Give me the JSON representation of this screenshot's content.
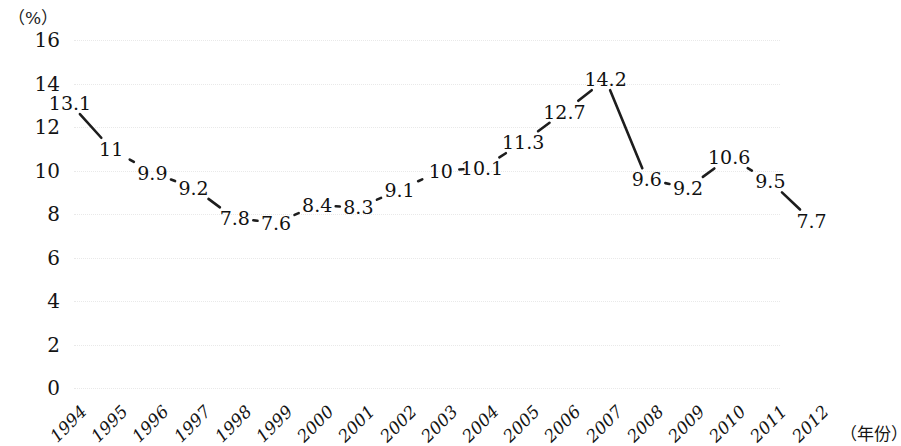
{
  "chart_data": {
    "type": "line",
    "title": "",
    "xlabel": "（年份）",
    "ylabel": "（%）",
    "ylim": [
      0,
      16
    ],
    "yticks": [
      "0",
      "2",
      "4",
      "6",
      "8",
      "10",
      "12",
      "14",
      "16"
    ],
    "grid": true,
    "legend": "none",
    "categories": [
      "1994",
      "1995",
      "1996",
      "1997",
      "1998",
      "1999",
      "2000",
      "2001",
      "2002",
      "2003",
      "2004",
      "2005",
      "2006",
      "2007",
      "2008",
      "2009",
      "2010",
      "2011",
      "2012"
    ],
    "values": [
      13.1,
      11,
      9.9,
      9.2,
      7.8,
      7.6,
      8.4,
      8.3,
      9.1,
      10,
      10.1,
      11.3,
      12.7,
      14.2,
      9.6,
      9.2,
      10.6,
      9.5,
      7.7
    ],
    "point_labels": [
      "13.1",
      "11",
      "9.9",
      "9.2",
      "7.8",
      "7.6",
      "8.4",
      "8.3",
      "9.1",
      "10",
      "10.1",
      "11.3",
      "12.7",
      "14.2",
      "9.6",
      "9.2",
      "10.6",
      "9.5",
      "7.7"
    ],
    "series": [
      {
        "name": "",
        "values": [
          13.1,
          11,
          9.9,
          9.2,
          7.8,
          7.6,
          8.4,
          8.3,
          9.1,
          10,
          10.1,
          11.3,
          12.7,
          14.2,
          9.6,
          9.2,
          10.6,
          9.5,
          7.7
        ]
      }
    ],
    "line_color": "#1d1d1d",
    "gridline_color": "#e9e9e9"
  }
}
